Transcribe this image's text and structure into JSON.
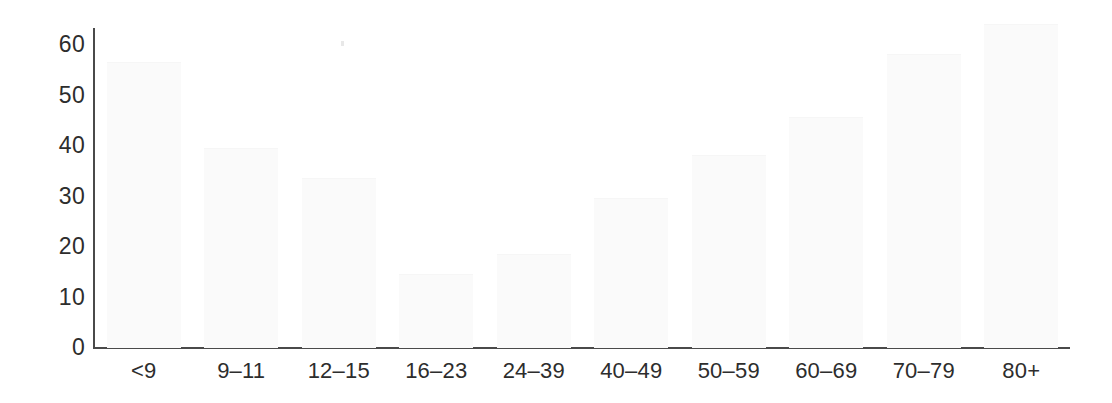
{
  "chart_data": {
    "type": "bar",
    "title": "",
    "subtitle": "",
    "xlabel": "",
    "ylabel": "",
    "categories": [
      "<9",
      "9–11",
      "12–15",
      "16–23",
      "24–39",
      "40–49",
      "50–59",
      "60–69",
      "70–79",
      "80+"
    ],
    "values": [
      56.5,
      39.5,
      33.5,
      14.5,
      18.5,
      29.5,
      38,
      45.5,
      58,
      64
    ],
    "ylim": [
      0,
      65
    ],
    "yticks": [
      0,
      10,
      20,
      30,
      40,
      50,
      60
    ],
    "ytick_labels": [
      "0",
      "10",
      "20",
      "30",
      "40",
      "50",
      "60"
    ],
    "grid": false,
    "legend": null,
    "bar_color": "#fafafa",
    "axis_color": "#4a4a4a",
    "text_color": "#2d2d2d",
    "background_color": "#ffffff"
  },
  "axes": {
    "y_axis_name": "value-axis",
    "x_axis_name": "category-axis"
  }
}
